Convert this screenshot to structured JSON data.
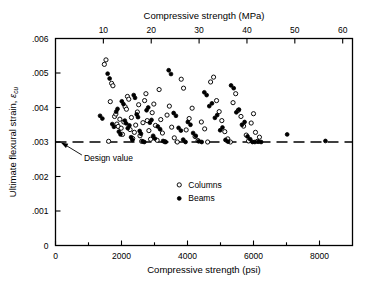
{
  "chart_data": {
    "type": "scatter",
    "title": "",
    "xlabel": "Compressive strength (psi)",
    "xlabel_top": "Compressive strength (MPa)",
    "ylabel": "Ultimate flexural strain, εcu",
    "ylabel_main": "Ultimate flexural strain, ",
    "ylabel_symbol": "ε",
    "ylabel_subscript": "cu",
    "xlim": [
      0,
      9000
    ],
    "ylim": [
      0,
      0.006
    ],
    "xlim_top": [
      0,
      62.05
    ],
    "grid": false,
    "legend_position": "inside-center-lower",
    "x_ticks_major": [
      0,
      2000,
      4000,
      6000,
      8000
    ],
    "x_tick_labels": [
      "0",
      "2000",
      "4000",
      "6000",
      "8000"
    ],
    "x_ticks_minor": [
      1000,
      3000,
      5000,
      7000
    ],
    "x_ticks_top_major": [
      10,
      20,
      30,
      40,
      50,
      60
    ],
    "x_tick_top_labels": [
      "10",
      "20",
      "30",
      "40",
      "50",
      "60"
    ],
    "y_ticks_major": [
      0,
      0.001,
      0.002,
      0.003,
      0.004,
      0.005,
      0.006
    ],
    "y_tick_labels": [
      "0",
      ".001",
      ".002",
      ".003",
      ".004",
      ".005",
      ".006"
    ],
    "annotations": [
      {
        "text": "Design value",
        "target_value": 0.003,
        "x": 860,
        "y": 0.00255
      }
    ],
    "reference_lines": [
      {
        "name": "design-value-line",
        "orientation": "horizontal",
        "value": 0.003,
        "style": "dashed",
        "color": "#000000"
      }
    ],
    "legend": [
      {
        "name": "Columns",
        "marker": "open-circle"
      },
      {
        "name": "Beams",
        "marker": "filled-circle"
      }
    ],
    "series": [
      {
        "name": "Columns",
        "marker": "open-circle",
        "color": "#000000",
        "points": [
          [
            1480,
            0.00525
          ],
          [
            1530,
            0.00538
          ],
          [
            1610,
            0.00302
          ],
          [
            1660,
            0.00417
          ],
          [
            1700,
            0.0047
          ],
          [
            1740,
            0.00463
          ],
          [
            1790,
            0.00374
          ],
          [
            1830,
            0.00381
          ],
          [
            1860,
            0.00352
          ],
          [
            1900,
            0.00345
          ],
          [
            1950,
            0.00366
          ],
          [
            1990,
            0.0034
          ],
          [
            2030,
            0.00322
          ],
          [
            2070,
            0.00358
          ],
          [
            2110,
            0.00402
          ],
          [
            2150,
            0.00395
          ],
          [
            2180,
            0.00432
          ],
          [
            2220,
            0.00424
          ],
          [
            2260,
            0.00336
          ],
          [
            2300,
            0.00371
          ],
          [
            2340,
            0.0031
          ],
          [
            2390,
            0.00328
          ],
          [
            2430,
            0.00349
          ],
          [
            2480,
            0.00387
          ],
          [
            2520,
            0.00408
          ],
          [
            2560,
            0.00318
          ],
          [
            2610,
            0.00302
          ],
          [
            2650,
            0.00356
          ],
          [
            2700,
            0.0042
          ],
          [
            2740,
            0.0044
          ],
          [
            2780,
            0.00362
          ],
          [
            2830,
            0.00333
          ],
          [
            2880,
            0.00308
          ],
          [
            2930,
            0.00385
          ],
          [
            2980,
            0.0041
          ],
          [
            3030,
            0.00348
          ],
          [
            3080,
            0.00305
          ],
          [
            3140,
            0.00452
          ],
          [
            3190,
            0.00365
          ],
          [
            3240,
            0.00326
          ],
          [
            3310,
            0.00301
          ],
          [
            3380,
            0.00378
          ],
          [
            3450,
            0.00404
          ],
          [
            3520,
            0.00343
          ],
          [
            3600,
            0.00312
          ],
          [
            3690,
            0.003
          ],
          [
            3810,
            0.00482
          ],
          [
            3880,
            0.00456
          ],
          [
            3960,
            0.00335
          ],
          [
            4050,
            0.00368
          ],
          [
            4140,
            0.00398
          ],
          [
            4230,
            0.00316
          ],
          [
            4320,
            0.00304
          ],
          [
            4420,
            0.00358
          ],
          [
            4520,
            0.00338
          ],
          [
            4610,
            0.003
          ],
          [
            4700,
            0.00474
          ],
          [
            4790,
            0.00488
          ],
          [
            4880,
            0.0042
          ],
          [
            4960,
            0.00388
          ],
          [
            5040,
            0.00362
          ],
          [
            5130,
            0.0033
          ],
          [
            5220,
            0.00309
          ],
          [
            5300,
            0.003
          ],
          [
            5380,
            0.00414
          ],
          [
            5460,
            0.0044
          ],
          [
            5540,
            0.00392
          ],
          [
            5620,
            0.00374
          ],
          [
            5700,
            0.00346
          ],
          [
            5780,
            0.0032
          ],
          [
            5850,
            0.00303
          ],
          [
            5930,
            0.00355
          ],
          [
            6000,
            0.00382
          ],
          [
            6060,
            0.00328
          ],
          [
            6120,
            0.00302
          ],
          [
            6180,
            0.00314
          ]
        ]
      },
      {
        "name": "Beams",
        "marker": "filled-circle",
        "color": "#000000",
        "points": [
          [
            1350,
            0.00376
          ],
          [
            1420,
            0.00368
          ],
          [
            1580,
            0.00498
          ],
          [
            1640,
            0.00484
          ],
          [
            1720,
            0.00352
          ],
          [
            1770,
            0.00344
          ],
          [
            1840,
            0.00388
          ],
          [
            1880,
            0.00396
          ],
          [
            1920,
            0.0033
          ],
          [
            1970,
            0.00322
          ],
          [
            2010,
            0.00418
          ],
          [
            2060,
            0.0041
          ],
          [
            2100,
            0.00362
          ],
          [
            2140,
            0.00354
          ],
          [
            2190,
            0.0034
          ],
          [
            2240,
            0.00348
          ],
          [
            2290,
            0.00314
          ],
          [
            2330,
            0.00306
          ],
          [
            2370,
            0.00436
          ],
          [
            2410,
            0.00428
          ],
          [
            2460,
            0.0038
          ],
          [
            2500,
            0.00372
          ],
          [
            2550,
            0.00332
          ],
          [
            2590,
            0.00324
          ],
          [
            2640,
            0.00302
          ],
          [
            2690,
            0.003
          ],
          [
            2760,
            0.00392
          ],
          [
            2810,
            0.004
          ],
          [
            2860,
            0.00356
          ],
          [
            2910,
            0.00364
          ],
          [
            2960,
            0.00318
          ],
          [
            3010,
            0.0031
          ],
          [
            3100,
            0.00345
          ],
          [
            3170,
            0.00337
          ],
          [
            3260,
            0.00303
          ],
          [
            3340,
            0.003
          ],
          [
            3430,
            0.00508
          ],
          [
            3500,
            0.00497
          ],
          [
            3580,
            0.00384
          ],
          [
            3650,
            0.00376
          ],
          [
            3730,
            0.00341
          ],
          [
            3800,
            0.00333
          ],
          [
            3870,
            0.00307
          ],
          [
            3940,
            0.003
          ],
          [
            4010,
            0.00358
          ],
          [
            4090,
            0.0035
          ],
          [
            4170,
            0.00326
          ],
          [
            4250,
            0.00318
          ],
          [
            4340,
            0.00302
          ],
          [
            4430,
            0.003
          ],
          [
            4510,
            0.00444
          ],
          [
            4580,
            0.00436
          ],
          [
            4660,
            0.00404
          ],
          [
            4740,
            0.00412
          ],
          [
            4830,
            0.0037
          ],
          [
            4900,
            0.00378
          ],
          [
            4990,
            0.00334
          ],
          [
            5060,
            0.00342
          ],
          [
            5150,
            0.00306
          ],
          [
            5230,
            0.00301
          ],
          [
            5320,
            0.00464
          ],
          [
            5400,
            0.00456
          ],
          [
            5480,
            0.00386
          ],
          [
            5560,
            0.00394
          ],
          [
            5650,
            0.0035
          ],
          [
            5730,
            0.00358
          ],
          [
            5820,
            0.00316
          ],
          [
            5900,
            0.00308
          ],
          [
            5970,
            0.003
          ],
          [
            6040,
            0.003
          ],
          [
            6150,
            0.00301
          ],
          [
            6230,
            0.003
          ],
          [
            7020,
            0.00322
          ],
          [
            8180,
            0.00303
          ]
        ]
      }
    ]
  }
}
